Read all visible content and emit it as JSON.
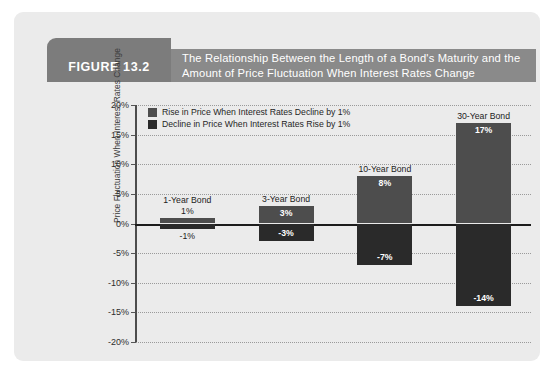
{
  "figure": {
    "number_label": "FIGURE 13.2",
    "title_line1": "The Relationship Between the Length of a Bond's Maturity and the",
    "title_line2": "Amount of Price Fluctuation When Interest Rates Change"
  },
  "colors": {
    "card_background": "#ebebeb",
    "tab_gray": "#7c7c7c",
    "band_gray": "#8a8a8a",
    "bar_positive": "#4d4d4d",
    "bar_negative": "#2a2a2a",
    "zero_line": "#1c1c1c",
    "gridline": "#9a9a9a"
  },
  "chart_data": {
    "type": "bar",
    "title": "The Relationship Between the Length of a Bond's Maturity and the Amount of Price Fluctuation When Interest Rates Change",
    "xlabel": "",
    "ylabel": "Price Fluctuation When Interest Rates Change",
    "ylim": [
      -20,
      20
    ],
    "ytick_labels": [
      "20%",
      "15%",
      "10%",
      "5%",
      "0%",
      "-5%",
      "-10%",
      "-15%",
      "-20%"
    ],
    "ytick_values": [
      20,
      15,
      10,
      5,
      0,
      -5,
      -10,
      -15,
      -20
    ],
    "grid": true,
    "legend_position": "top-left-inside",
    "categories": [
      "1-Year Bond",
      "3-Year Bond",
      "10-Year Bond",
      "30-Year Bond"
    ],
    "series": [
      {
        "name": "Rise in Price When Interest Rates Decline by 1%",
        "color": "#4d4d4d",
        "values": [
          1,
          3,
          8,
          17
        ],
        "labels": [
          "1%",
          "3%",
          "8%",
          "17%"
        ]
      },
      {
        "name": "Decline in Price When Interest Rates Rise by 1%",
        "color": "#2a2a2a",
        "values": [
          -1,
          -3,
          -7,
          -14
        ],
        "labels": [
          "-1%",
          "-3%",
          "-7%",
          "-14%"
        ]
      }
    ]
  },
  "legend": {
    "items": [
      {
        "label": "Rise in Price When Interest Rates Decline by 1%",
        "color": "#4d4d4d"
      },
      {
        "label": "Decline in Price When Interest Rates Rise by 1%",
        "color": "#2a2a2a"
      }
    ]
  },
  "groups": [
    {
      "name": "1-Year Bond",
      "pos_label": "1%",
      "neg_label": "-1%",
      "pos_inside": false,
      "neg_inside": false
    },
    {
      "name": "3-Year Bond",
      "pos_label": "3%",
      "neg_label": "-3%",
      "pos_inside": true,
      "neg_inside": true
    },
    {
      "name": "10-Year Bond",
      "pos_label": "8%",
      "neg_label": "-7%",
      "pos_inside": true,
      "neg_inside": true
    },
    {
      "name": "30-Year Bond",
      "pos_label": "17%",
      "neg_label": "-14%",
      "pos_inside": true,
      "neg_inside": true
    }
  ]
}
